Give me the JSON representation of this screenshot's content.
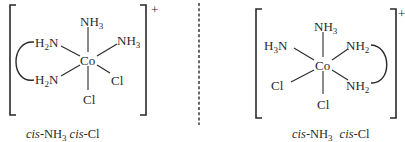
{
  "figure": {
    "separator": "dashed-vertical-line",
    "left_isomer": {
      "charge": "+",
      "center": "Co",
      "ligands": {
        "top": {
          "main": "NH",
          "sub": "3"
        },
        "upper_left": {
          "pre": "H",
          "pre_sub": "2",
          "main": "N"
        },
        "upper_right": {
          "main": "NH",
          "sub": "3"
        },
        "lower_left": {
          "pre": "H",
          "pre_sub": "2",
          "main": "N"
        },
        "lower_right": {
          "main": "Cl"
        },
        "bottom": {
          "main": "Cl"
        }
      },
      "chelate": "left-arc joining the two H2N groups",
      "caption": {
        "part1_italic": "cis",
        "part1_rest": "-NH",
        "part1_sub": "3",
        "part2_italic": "cis",
        "part2_rest": "-Cl"
      }
    },
    "right_isomer": {
      "charge": "+",
      "center": "Co",
      "ligands": {
        "top": {
          "main": "NH",
          "sub": "3"
        },
        "upper_left": {
          "pre": "H",
          "pre_sub": "3",
          "main": "N"
        },
        "upper_right": {
          "main": "NH",
          "sub": "2"
        },
        "lower_left": {
          "main": "Cl"
        },
        "lower_right": {
          "main": "NH",
          "sub": "2"
        },
        "bottom": {
          "main": "Cl"
        }
      },
      "chelate": "right-arc joining the two NH2 groups",
      "caption": {
        "part1_italic": "cis",
        "part1_rest": "-NH",
        "part1_sub": "3",
        "part2_italic": "cis",
        "part2_rest": "-Cl"
      }
    }
  }
}
